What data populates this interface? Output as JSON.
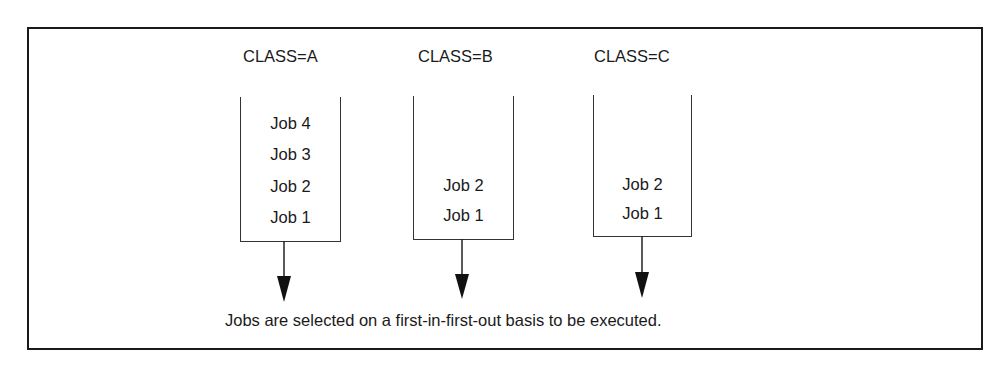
{
  "diagram": {
    "classes": [
      {
        "label": "CLASS=A",
        "jobs": [
          "Job 4",
          "Job 3",
          "Job 2",
          "Job 1"
        ]
      },
      {
        "label": "CLASS=B",
        "jobs": [
          "Job 2",
          "Job 1"
        ]
      },
      {
        "label": "CLASS=C",
        "jobs": [
          "Job 2",
          "Job 1"
        ]
      }
    ],
    "caption": "Jobs are selected on a first-in-first-out basis to be executed."
  }
}
